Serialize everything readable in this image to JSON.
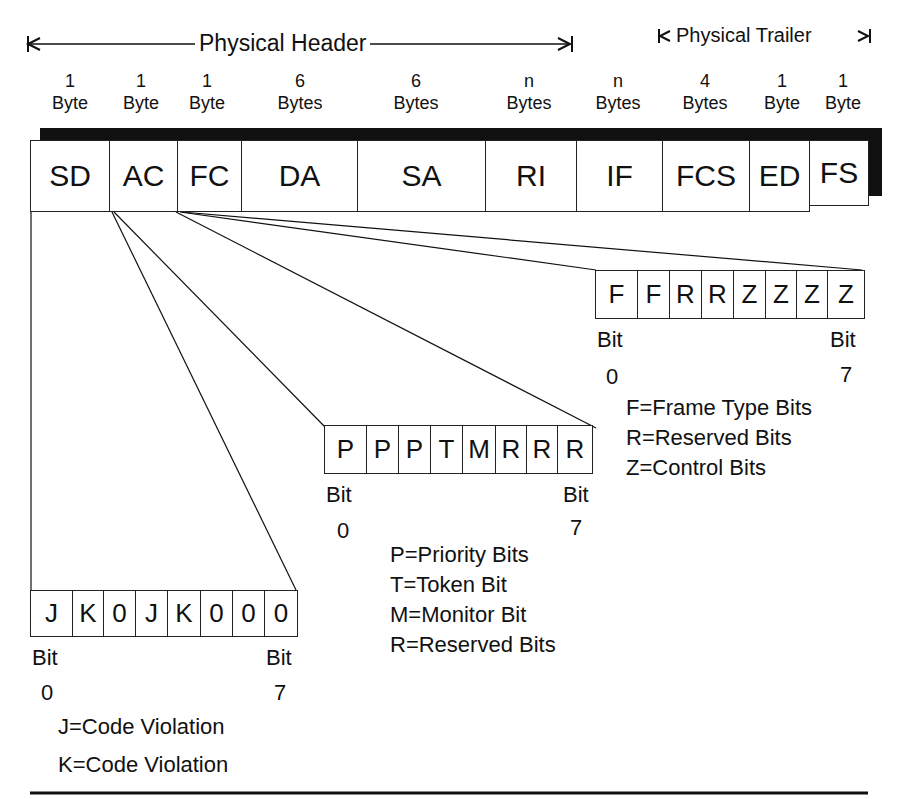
{
  "header_span": {
    "label": "Physical Header"
  },
  "trailer_span": {
    "label": "Physical Trailer"
  },
  "fields": [
    {
      "name": "SD",
      "size_num": "1",
      "size_unit": "Byte"
    },
    {
      "name": "AC",
      "size_num": "1",
      "size_unit": "Byte"
    },
    {
      "name": "FC",
      "size_num": "1",
      "size_unit": "Byte"
    },
    {
      "name": "DA",
      "size_num": "6",
      "size_unit": "Bytes"
    },
    {
      "name": "SA",
      "size_num": "6",
      "size_unit": "Bytes"
    },
    {
      "name": "RI",
      "size_num": "n",
      "size_unit": "Bytes"
    },
    {
      "name": "IF",
      "size_num": "n",
      "size_unit": "Bytes"
    },
    {
      "name": "FCS",
      "size_num": "4",
      "size_unit": "Bytes"
    },
    {
      "name": "ED",
      "size_num": "1",
      "size_unit": "Byte"
    },
    {
      "name": "FS",
      "size_num": "1",
      "size_unit": "Byte"
    }
  ],
  "fc_bits": {
    "bits": [
      "F",
      "F",
      "R",
      "R",
      "Z",
      "Z",
      "Z",
      "Z"
    ],
    "bit_start_label": "Bit",
    "bit_start_num": "0",
    "bit_end_label": "Bit",
    "bit_end_num": "7",
    "legend": [
      "F=Frame Type Bits",
      "R=Reserved Bits",
      "Z=Control Bits"
    ]
  },
  "ac_bits": {
    "bits": [
      "P",
      "P",
      "P",
      "T",
      "M",
      "R",
      "R",
      "R"
    ],
    "bit_start_label": "Bit",
    "bit_start_num": "0",
    "bit_end_label": "Bit",
    "bit_end_num": "7",
    "legend": [
      "P=Priority Bits",
      "T=Token Bit",
      "M=Monitor Bit",
      "R=Reserved Bits"
    ]
  },
  "sd_bits": {
    "bits": [
      "J",
      "K",
      "0",
      "J",
      "K",
      "0",
      "0",
      "0"
    ],
    "bit_start_label": "Bit",
    "bit_start_num": "0",
    "bit_end_label": "Bit",
    "bit_end_num": "7",
    "legend": [
      "J=Code Violation",
      "K=Code Violation"
    ]
  }
}
